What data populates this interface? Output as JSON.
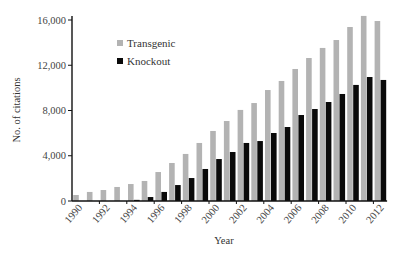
{
  "chart_data": {
    "type": "bar",
    "title": "",
    "xlabel": "Year",
    "ylabel": "No. of citations",
    "ylim": [
      0,
      16000
    ],
    "yticks": [
      0,
      4000,
      8000,
      12000,
      16000
    ],
    "ytick_labels": [
      "0",
      "4,000",
      "8,000",
      "12,000",
      "16,000"
    ],
    "xtick_labels": [
      "1990",
      "1992",
      "1994",
      "1996",
      "1998",
      "2000",
      "2002",
      "2004",
      "2006",
      "2008",
      "2010",
      "2012"
    ],
    "grid": false,
    "legend_position": "upper-left",
    "categories": [
      "1990",
      "1991",
      "1992",
      "1993",
      "1994",
      "1995",
      "1996",
      "1997",
      "1998",
      "1999",
      "2000",
      "2001",
      "2002",
      "2003",
      "2004",
      "2005",
      "2006",
      "2007",
      "2008",
      "2009",
      "2010",
      "2011",
      "2012"
    ],
    "series": [
      {
        "name": "Transgenic",
        "color": "#b3b3b3",
        "values": [
          530,
          800,
          970,
          1240,
          1500,
          1770,
          2560,
          3360,
          4160,
          5130,
          6190,
          7070,
          8050,
          8660,
          9810,
          10610,
          11670,
          12640,
          13530,
          14230,
          15380,
          16360,
          15910
        ]
      },
      {
        "name": "Knockout",
        "color": "#0a0a0a",
        "values": [
          0,
          0,
          0,
          0,
          100,
          350,
          800,
          1410,
          2030,
          2830,
          3710,
          4330,
          5130,
          5300,
          6010,
          6540,
          7600,
          8130,
          8750,
          9460,
          10260,
          10960,
          10700
        ]
      }
    ]
  }
}
